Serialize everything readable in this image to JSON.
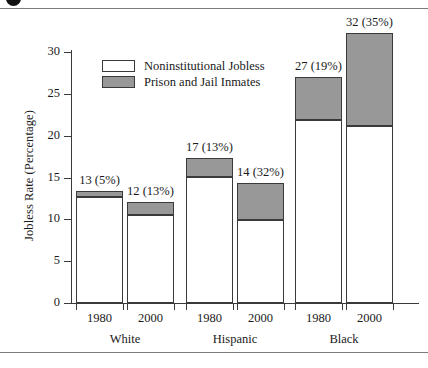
{
  "figure": {
    "badge_icon": "figure-number-badge"
  },
  "chart_data": {
    "type": "bar",
    "subtype": "stacked",
    "title": "",
    "xlabel": "",
    "ylabel": "Jobless Rate (Percentage)",
    "ylim": [
      0,
      30
    ],
    "yticks": [
      0,
      5,
      10,
      15,
      20,
      25,
      30
    ],
    "ytick_labels": [
      "0",
      "5",
      "10",
      "15",
      "20",
      "25",
      "30"
    ],
    "grid": false,
    "legend_position": "upper-left-inside",
    "legend": [
      {
        "name": "Noninstitutional Jobless",
        "color": "#ffffff"
      },
      {
        "name": "Prison and Jail Inmates",
        "color": "#989898"
      }
    ],
    "groups": [
      "White",
      "Hispanic",
      "Black"
    ],
    "categories": [
      "1980",
      "2000",
      "1980",
      "2000",
      "1980",
      "2000"
    ],
    "series": [
      {
        "name": "Noninstitutional Jobless",
        "values": [
          12.7,
          10.5,
          15.1,
          9.9,
          21.9,
          21.1
        ]
      },
      {
        "name": "Prison and Jail Inmates",
        "values": [
          0.65,
          1.6,
          2.2,
          4.5,
          5.1,
          11.2
        ]
      }
    ],
    "bars": [
      {
        "group": "White",
        "year": "1980",
        "total": 13,
        "inmate_share_pct": 5,
        "label": "13 (5%)",
        "jobless": 12.7,
        "inmates": 0.65
      },
      {
        "group": "White",
        "year": "2000",
        "total": 12,
        "inmate_share_pct": 13,
        "label": "12 (13%)",
        "jobless": 10.5,
        "inmates": 1.6
      },
      {
        "group": "Hispanic",
        "year": "1980",
        "total": 17,
        "inmate_share_pct": 13,
        "label": "17 (13%)",
        "jobless": 15.1,
        "inmates": 2.2
      },
      {
        "group": "Hispanic",
        "year": "2000",
        "total": 14,
        "inmate_share_pct": 32,
        "label": "14 (32%)",
        "jobless": 9.9,
        "inmates": 4.5
      },
      {
        "group": "Black",
        "year": "1980",
        "total": 27,
        "inmate_share_pct": 19,
        "label": "27 (19%)",
        "jobless": 21.9,
        "inmates": 5.1
      },
      {
        "group": "Black",
        "year": "2000",
        "total": 32,
        "inmate_share_pct": 35,
        "label": "32 (35%)",
        "jobless": 21.1,
        "inmates": 11.2
      }
    ]
  }
}
